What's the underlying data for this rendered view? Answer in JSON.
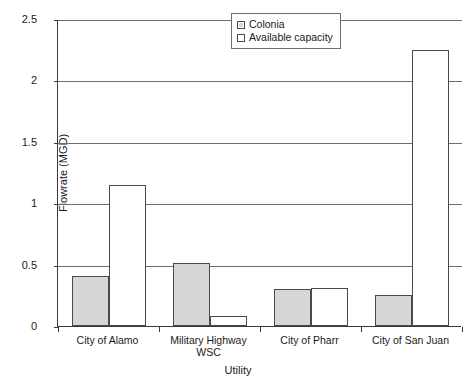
{
  "chart_data": {
    "type": "bar",
    "title": "",
    "subtitle": "",
    "xlabel": "Utility",
    "ylabel": "Flowrate (MGD)",
    "ylim": [
      0,
      2.5
    ],
    "yticks": [
      "0",
      "0.5",
      "1",
      "1.5",
      "2",
      "2.5"
    ],
    "ytick_values": [
      0,
      0.5,
      1,
      1.5,
      2,
      2.5
    ],
    "grid": "horizontal",
    "legend_position": "upper-right-inside",
    "categories": [
      "City of Alamo",
      "Military Highway WSC",
      "City of Pharr",
      "City of San Juan"
    ],
    "category_lines": [
      [
        "City of Alamo"
      ],
      [
        "Military Highway",
        "WSC"
      ],
      [
        "City of Pharr"
      ],
      [
        "City of San Juan"
      ]
    ],
    "series": [
      {
        "name": "Colonia",
        "fill": "#d6d6d6",
        "border": "#4a4a4a",
        "values": [
          0.41,
          0.51,
          0.3,
          0.25
        ]
      },
      {
        "name": "Available capacity",
        "fill": "#ffffff",
        "border": "#4a4a4a",
        "values": [
          1.15,
          0.08,
          0.31,
          2.25
        ]
      }
    ]
  },
  "legend": {
    "items": [
      {
        "label": "Colonia",
        "swatch": "legend-swatch-colonia"
      },
      {
        "label": "Available capacity",
        "swatch": "legend-swatch-available-capacity"
      }
    ]
  },
  "axes": {
    "y_title": "Flowrate (MGD)",
    "x_title": "Utility",
    "y_labels": [
      "2.5",
      "2",
      "1.5",
      "1",
      "0.5",
      "0"
    ]
  }
}
